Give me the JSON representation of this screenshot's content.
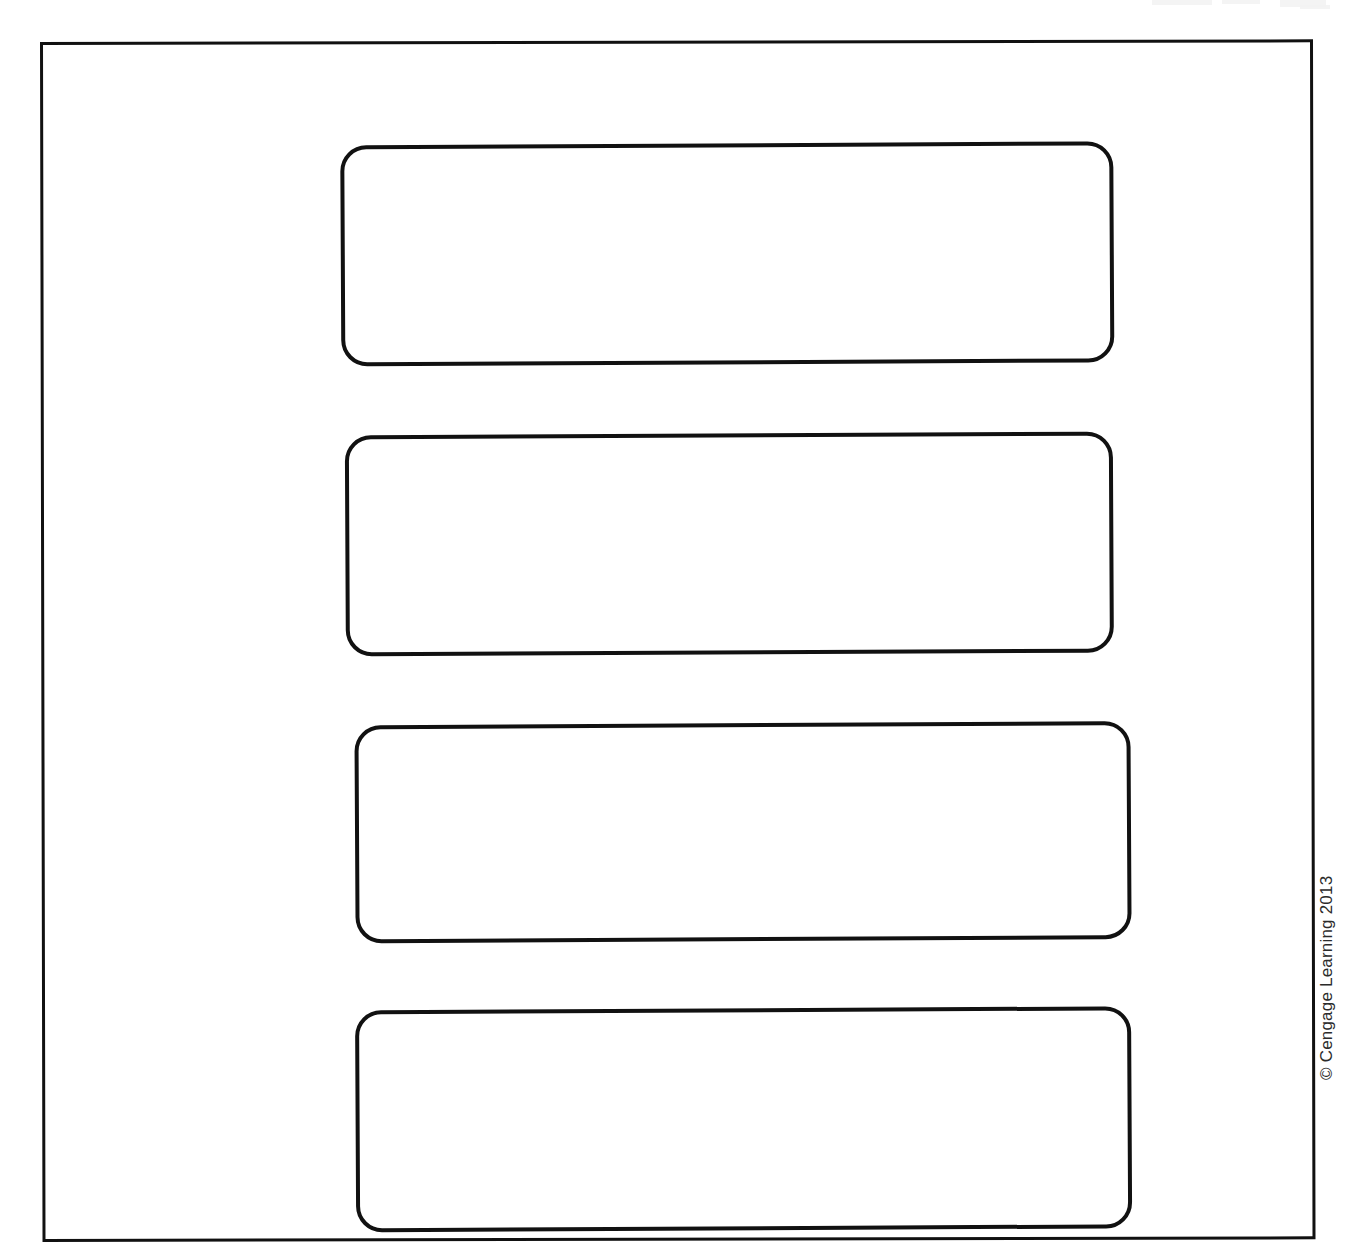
{
  "page": {
    "background_color": "#ffffff",
    "width": 1358,
    "height": 1252
  },
  "frame": {
    "name": "outer-border",
    "stroke_color": "#111111",
    "stroke_width": 3,
    "corner_style": "square"
  },
  "boxes": [
    {
      "index": 1,
      "label": "",
      "placeholder": "",
      "stroke_color": "#111111",
      "fill_color": "#ffffff",
      "corner_radius": 26
    },
    {
      "index": 2,
      "label": "",
      "placeholder": "",
      "stroke_color": "#111111",
      "fill_color": "#ffffff",
      "corner_radius": 26
    },
    {
      "index": 3,
      "label": "",
      "placeholder": "",
      "stroke_color": "#111111",
      "fill_color": "#ffffff",
      "corner_radius": 26
    },
    {
      "index": 4,
      "label": "",
      "placeholder": "",
      "stroke_color": "#111111",
      "fill_color": "#ffffff",
      "corner_radius": 26
    }
  ],
  "credit": {
    "text": "© Cengage Learning 2013",
    "orientation": "vertical-rotated-90",
    "color": "#2b2b2b"
  }
}
